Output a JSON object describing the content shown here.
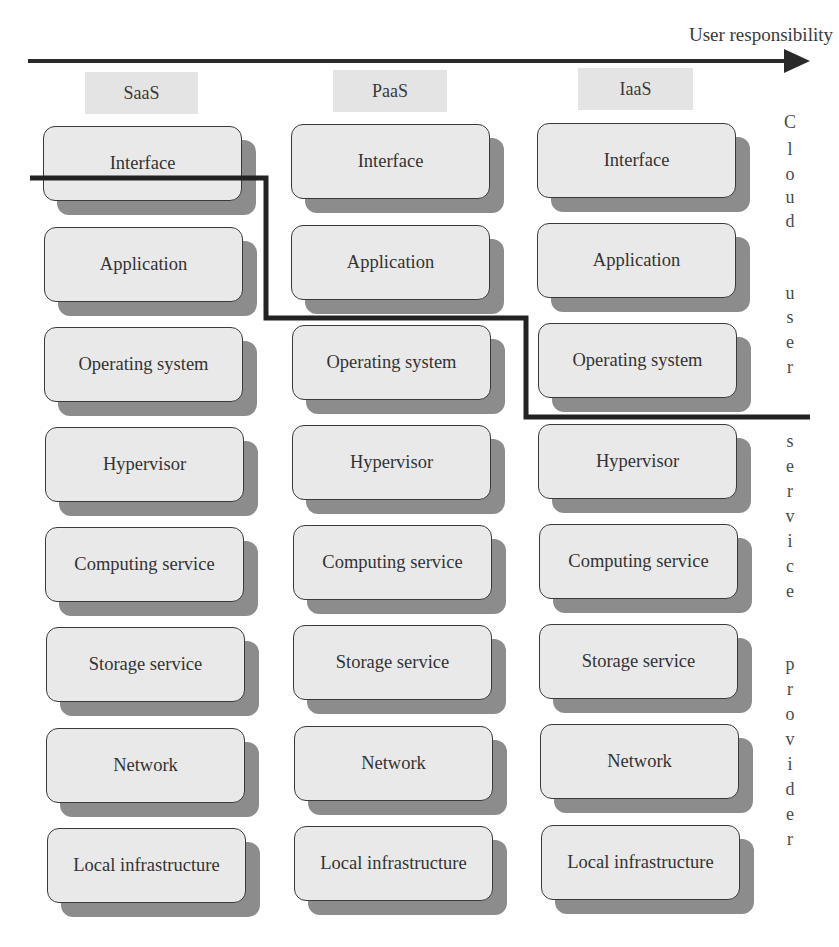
{
  "axis": {
    "label": "User responsibility",
    "direction": "left-to-right"
  },
  "columns": [
    {
      "label": "SaaS",
      "layers": [
        "Interface",
        "Application",
        "Operating system",
        "Hypervisor",
        "Computing service",
        "Storage service",
        "Network",
        "Local infrastructure"
      ],
      "user_managed_layers": 0
    },
    {
      "label": "PaaS",
      "layers": [
        "Interface",
        "Application",
        "Operating system",
        "Hypervisor",
        "Computing service",
        "Storage service",
        "Network",
        "Local infrastructure"
      ],
      "user_managed_layers": 2
    },
    {
      "label": "IaaS",
      "layers": [
        "Interface",
        "Application",
        "Operating system",
        "Hypervisor",
        "Computing service",
        "Storage service",
        "Network",
        "Local infrastructure"
      ],
      "user_managed_layers": 3
    }
  ],
  "side_labels": {
    "upper": "Cloud user",
    "lower": "service provider",
    "letters": [
      "C",
      "l",
      "o",
      "u",
      "d",
      "",
      "u",
      "s",
      "e",
      "r",
      "",
      "s",
      "e",
      "r",
      "v",
      "i",
      "c",
      "e",
      "",
      "p",
      "r",
      "o",
      "v",
      "i",
      "d",
      "e",
      "r"
    ]
  },
  "colors": {
    "box_fill": "#e9e9e9",
    "box_border": "#3a3a3a",
    "box_shadow": "#8c8c8c",
    "label_fill": "#e4e4e4",
    "boundary_line": "#222222",
    "arrow": "#2a2a2a"
  }
}
